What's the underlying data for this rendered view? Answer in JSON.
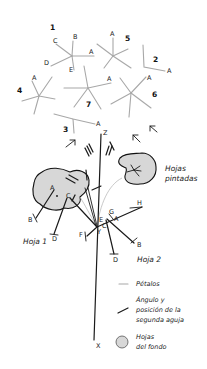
{
  "diagram": {
    "flowers": [
      {
        "number": "1",
        "petal_labels": [
          "A",
          "B",
          "C",
          "D",
          "E"
        ]
      },
      {
        "number": "2",
        "petal_labels": [
          "A"
        ]
      },
      {
        "number": "3",
        "petal_labels": [
          "A"
        ]
      },
      {
        "number": "4",
        "petal_labels": [
          "A"
        ]
      },
      {
        "number": "5",
        "petal_labels": [
          "A"
        ]
      },
      {
        "number": "6",
        "petal_labels": [
          "A"
        ]
      },
      {
        "number": "7",
        "petal_labels": [
          "A"
        ]
      }
    ],
    "stem": {
      "top_label": "Z",
      "bottom_label": "X",
      "junction_label": "Y"
    },
    "leaf1": {
      "title": "Hoja 1",
      "point_labels": [
        "A",
        "B",
        "C",
        "D"
      ]
    },
    "leaf2": {
      "title": "Hoja 2",
      "point_labels": [
        "A",
        "B",
        "C",
        "D",
        "E",
        "F",
        "G",
        "H"
      ]
    },
    "painted_leaves": {
      "line1": "Hojas",
      "line2": "pintadas"
    },
    "legend": {
      "petals": "Pétalos",
      "needle_line1": "Ángulo y",
      "needle_line2": "posición de la",
      "needle_line3": "segunda aguja",
      "bg_leaves_line1": "Hojas",
      "bg_leaves_line2": "del fondo"
    },
    "colors": {
      "petal_gray": "#a8a8a8",
      "leaf_fill": "#d7d7d7",
      "ink": "#1a1a1a"
    }
  }
}
